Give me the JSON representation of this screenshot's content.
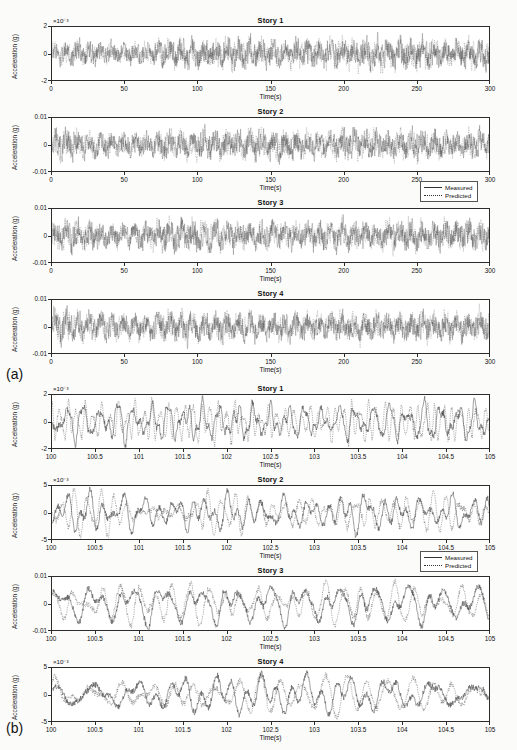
{
  "figure": {
    "sections": [
      {
        "tag": "(a)",
        "legend": {
          "items": [
            {
              "label": "Measured",
              "style": "solid"
            },
            {
              "label": "Predicted",
              "style": "dotted"
            }
          ]
        },
        "xlabel": "Time(s)",
        "ylabel": "Acceleration (g)",
        "xlim": [
          0,
          300
        ],
        "xticks": [
          "0",
          "50",
          "100",
          "150",
          "200",
          "250",
          "300"
        ],
        "panels": [
          {
            "title": "Story 1",
            "exponent": "×10⁻³",
            "yticks": [
              "2",
              "0",
              "-2"
            ],
            "ylim": [
              -3,
              3
            ],
            "amp": 2.15,
            "seed": 11,
            "env": [
              0.62,
              0.7,
              0.66,
              0.6,
              0.58,
              0.64,
              0.8,
              0.86,
              0.78,
              0.82,
              0.88,
              0.84,
              0.8,
              0.86,
              0.82,
              0.78,
              0.84,
              0.92,
              0.86,
              1.0,
              0.88,
              0.84,
              0.9,
              0.86
            ]
          },
          {
            "title": "Story 2",
            "exponent": "",
            "yticks": [
              "0.01",
              "0",
              "-0.01"
            ],
            "ylim": [
              -0.013,
              0.013
            ],
            "amp": 0.0062,
            "seed": 23,
            "env": [
              0.9,
              0.84,
              0.74,
              0.66,
              0.62,
              0.7,
              0.8,
              0.84,
              0.78,
              0.86,
              0.82,
              0.8,
              0.86,
              0.82,
              0.78,
              0.84,
              0.88,
              0.84,
              0.8,
              0.86,
              0.82,
              0.8,
              0.84,
              0.8
            ]
          },
          {
            "title": "Story 3",
            "exponent": "",
            "yticks": [
              "0.01",
              "0",
              "-0.01"
            ],
            "ylim": [
              -0.013,
              0.013
            ],
            "amp": 0.006,
            "seed": 37,
            "env": [
              0.82,
              0.86,
              0.8,
              0.76,
              0.7,
              0.78,
              0.92,
              0.96,
              0.84,
              0.8,
              0.78,
              0.82,
              0.8,
              0.76,
              0.8,
              0.84,
              0.82,
              0.78,
              0.84,
              0.86,
              0.82,
              0.8,
              0.84,
              0.82
            ]
          },
          {
            "title": "Story 4",
            "exponent": "",
            "yticks": [
              "0.01",
              "0",
              "-0.01"
            ],
            "ylim": [
              -0.013,
              0.013
            ],
            "amp": 0.0064,
            "seed": 53,
            "env": [
              0.96,
              0.92,
              0.82,
              0.74,
              0.68,
              0.76,
              0.88,
              0.92,
              0.8,
              0.84,
              0.8,
              0.78,
              0.82,
              0.8,
              0.76,
              0.82,
              0.86,
              0.82,
              0.78,
              0.84,
              0.8,
              0.78,
              0.82,
              0.8
            ]
          }
        ]
      },
      {
        "tag": "(b)",
        "legend": {
          "items": [
            {
              "label": "Measured",
              "style": "solid"
            },
            {
              "label": "Predicted",
              "style": "dotted"
            }
          ]
        },
        "xlabel": "Time(s)",
        "ylabel": "Acceleration (g)",
        "xlim": [
          100,
          105
        ],
        "xticks": [
          "100",
          "100.5",
          "101",
          "101.5",
          "102",
          "102.5",
          "103",
          "103.5",
          "104",
          "104.5",
          "105"
        ],
        "panels": [
          {
            "title": "Story 1",
            "exponent": "×10⁻³",
            "yticks": [
              "2",
              "0",
              "-2"
            ],
            "ylim": [
              -2.4,
              2.4
            ],
            "amp": 1.25,
            "seed": 101,
            "freq": 9.2,
            "env": [
              0.95,
              1.0,
              0.92,
              0.88,
              0.95,
              0.9,
              0.85,
              0.8,
              0.9,
              0.95,
              1.0,
              0.9
            ]
          },
          {
            "title": "Story 2",
            "exponent": "×10⁻³",
            "yticks": [
              "5",
              "0",
              "-5"
            ],
            "ylim": [
              -6,
              6
            ],
            "amp": 3.1,
            "seed": 202,
            "freq": 5.6,
            "env": [
              0.9,
              1.0,
              0.85,
              0.9,
              0.95,
              0.88,
              0.82,
              0.9,
              0.96,
              0.9,
              0.85,
              0.92
            ]
          },
          {
            "title": "Story 3",
            "exponent": "",
            "yticks": [
              "0.01",
              "0",
              "-0.01"
            ],
            "ylim": [
              -0.012,
              0.012
            ],
            "amp": 0.0048,
            "seed": 303,
            "freq": 4.4,
            "env": [
              0.85,
              0.92,
              1.0,
              0.88,
              0.9,
              0.95,
              0.85,
              0.9,
              0.96,
              0.88,
              0.92,
              0.9
            ]
          },
          {
            "title": "Story 4",
            "exponent": "×10⁻³",
            "yticks": [
              "5",
              "0",
              "-5"
            ],
            "ylim": [
              -7,
              7
            ],
            "amp": 4.2,
            "seed": 404,
            "freq": 3.6,
            "env": [
              0.9,
              0.95,
              0.88,
              0.92,
              1.0,
              0.9,
              0.85,
              0.94,
              0.9,
              0.96,
              0.88,
              0.92
            ]
          }
        ]
      }
    ]
  },
  "chart_data": {
    "type": "line",
    "xlabel": "Time(s)",
    "ylabel": "Acceleration (g)",
    "series_names": [
      "Measured",
      "Predicted"
    ],
    "subplots": [
      {
        "panel": "(a) Story 1",
        "xlim": [
          0,
          300
        ],
        "ylim": [
          -0.003,
          0.003
        ],
        "yticks": [
          -0.002,
          0,
          0.002
        ],
        "xticks": [
          0,
          50,
          100,
          150,
          200,
          250,
          300
        ],
        "y_exponent": -3,
        "peak_abs": 0.0024
      },
      {
        "panel": "(a) Story 2",
        "xlim": [
          0,
          300
        ],
        "ylim": [
          -0.013,
          0.013
        ],
        "yticks": [
          -0.01,
          0,
          0.01
        ],
        "xticks": [
          0,
          50,
          100,
          150,
          200,
          250,
          300
        ],
        "peak_abs": 0.008
      },
      {
        "panel": "(a) Story 3",
        "xlim": [
          0,
          300
        ],
        "ylim": [
          -0.013,
          0.013
        ],
        "yticks": [
          -0.01,
          0,
          0.01
        ],
        "xticks": [
          0,
          50,
          100,
          150,
          200,
          250,
          300
        ],
        "peak_abs": 0.0085
      },
      {
        "panel": "(a) Story 4",
        "xlim": [
          0,
          300
        ],
        "ylim": [
          -0.013,
          0.013
        ],
        "yticks": [
          -0.01,
          0,
          0.01
        ],
        "xticks": [
          0,
          50,
          100,
          150,
          200,
          250,
          300
        ],
        "peak_abs": 0.009
      },
      {
        "panel": "(b) Story 1",
        "xlim": [
          100,
          105
        ],
        "ylim": [
          -0.0024,
          0.0024
        ],
        "yticks": [
          -0.002,
          0,
          0.002
        ],
        "xticks": [
          100,
          100.5,
          101,
          101.5,
          102,
          102.5,
          103,
          103.5,
          104,
          104.5,
          105
        ],
        "y_exponent": -3,
        "peak_abs": 0.0018
      },
      {
        "panel": "(b) Story 2",
        "xlim": [
          100,
          105
        ],
        "ylim": [
          -0.006,
          0.006
        ],
        "yticks": [
          -0.005,
          0,
          0.005
        ],
        "xticks": [
          100,
          100.5,
          101,
          101.5,
          102,
          102.5,
          103,
          103.5,
          104,
          104.5,
          105
        ],
        "y_exponent": -3,
        "peak_abs": 0.005
      },
      {
        "panel": "(b) Story 3",
        "xlim": [
          100,
          105
        ],
        "ylim": [
          -0.012,
          0.012
        ],
        "yticks": [
          -0.01,
          0,
          0.01
        ],
        "xticks": [
          100,
          100.5,
          101,
          101.5,
          102,
          102.5,
          103,
          103.5,
          104,
          104.5,
          105
        ],
        "peak_abs": 0.007
      },
      {
        "panel": "(b) Story 4",
        "xlim": [
          100,
          105
        ],
        "ylim": [
          -0.007,
          0.007
        ],
        "yticks": [
          -0.005,
          0,
          0.005
        ],
        "xticks": [
          100,
          100.5,
          101,
          101.5,
          102,
          102.5,
          103,
          103.5,
          104,
          104.5,
          105
        ],
        "peak_abs": 0.0065
      }
    ],
    "legend_position": "right, below second panel of each section",
    "grid": false
  }
}
